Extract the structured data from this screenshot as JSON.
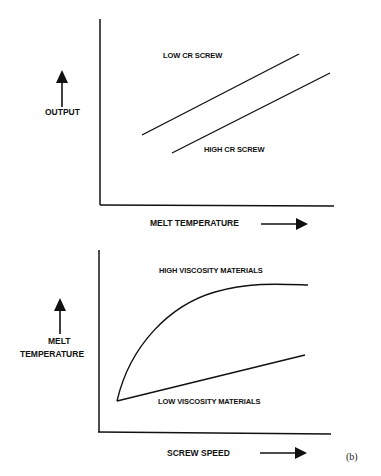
{
  "diagram": {
    "panel_label": "(b)",
    "top_plot": {
      "x_axis_label": "MELT TEMPERATURE",
      "y_axis_label": "OUTPUT",
      "curves": [
        {
          "label": "LOW CR SCREW",
          "shape": "straight-line",
          "from": [
            142,
            135
          ],
          "to": [
            299,
            54
          ]
        },
        {
          "label": "HIGH CR SCREW",
          "shape": "straight-line",
          "from": [
            172,
            153
          ],
          "to": [
            330,
            73
          ]
        }
      ]
    },
    "bottom_plot": {
      "x_axis_label": "SCREW SPEED",
      "y_axis_label_line1": "MELT",
      "y_axis_label_line2": "TEMPERATURE",
      "curves": [
        {
          "label": "HIGH VISCOSITY MATERIALS",
          "shape": "concave-saturating-curve"
        },
        {
          "label": "LOW VISCOSITY MATERIALS",
          "shape": "straight-line"
        }
      ]
    },
    "line_color": "#111111",
    "background": "#ffffff"
  }
}
